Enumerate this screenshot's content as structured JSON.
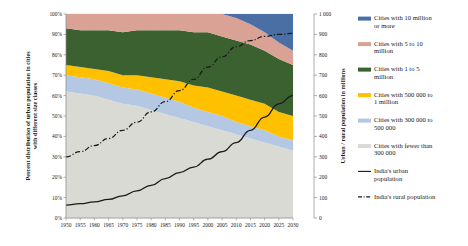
{
  "chart_data": {
    "type": "area",
    "title": "",
    "xlabel": "",
    "ylabel": "Percent distribution of urban population in cities with different size classes",
    "y2label": "Urban / rural population in millions",
    "x": [
      1950,
      1955,
      1960,
      1965,
      1970,
      1975,
      1980,
      1985,
      1990,
      1995,
      2000,
      2005,
      2010,
      2015,
      2020,
      2025,
      2030
    ],
    "xtick_labels": [
      "1950",
      "1955",
      "1960",
      "1965",
      "1970",
      "1975",
      "1980",
      "1985",
      "1990",
      "1995",
      "2000",
      "2005",
      "2010",
      "2015",
      "2020",
      "2025",
      "2030"
    ],
    "ylim": [
      0,
      100
    ],
    "ytick_labels": [
      "0%",
      "10%",
      "20%",
      "30%",
      "40%",
      "50%",
      "60%",
      "70%",
      "80%",
      "90%",
      "100%"
    ],
    "ytick_values": [
      0,
      10,
      20,
      30,
      40,
      50,
      60,
      70,
      80,
      90,
      100
    ],
    "y2lim": [
      0,
      1000
    ],
    "y2tick_labels": [
      "0",
      "100",
      "200",
      "300",
      "400",
      "500",
      "600",
      "700",
      "800",
      "900",
      "1 000"
    ],
    "y2tick_values": [
      0,
      100,
      200,
      300,
      400,
      500,
      600,
      700,
      800,
      900,
      1000
    ],
    "grid": true,
    "legend_position": "right",
    "stack_order_bottom_to_top": [
      "fewer_300k",
      "300k_500k",
      "500k_1m",
      "1m_5m",
      "5m_10m",
      "10m_plus"
    ],
    "series": [
      {
        "name": "Cities with fewer than 300 000",
        "key": "fewer_300k",
        "color": "#d9dad4",
        "values": [
          62,
          61,
          60,
          58,
          56,
          55,
          53,
          51,
          49,
          47,
          45,
          43,
          41,
          39,
          37,
          35,
          33
        ]
      },
      {
        "name": "Cities with 300 000 to 500 000",
        "key": "300k_500k",
        "color": "#b4c7e3",
        "values": [
          8,
          8,
          8,
          8,
          8,
          8,
          8,
          8,
          8,
          7,
          7,
          7,
          6,
          6,
          6,
          5,
          5
        ]
      },
      {
        "name": "Cities with 500 000 to 1 million",
        "key": "500k_1m",
        "color": "#ffc000",
        "values": [
          5,
          5,
          5,
          6,
          6,
          7,
          8,
          9,
          10,
          11,
          12,
          12,
          13,
          13,
          13,
          12,
          12
        ]
      },
      {
        "name": "Cities with 1 to 5 million",
        "key": "1m_5m",
        "color": "#3c6130",
        "values": [
          18,
          18,
          19,
          20,
          21,
          22,
          23,
          24,
          25,
          26,
          27,
          27,
          27,
          27,
          26,
          26,
          25
        ]
      },
      {
        "name": "Cities with 5 to 10 million",
        "key": "5m_10m",
        "color": "#d9a295",
        "values": [
          7,
          8,
          8,
          8,
          9,
          8,
          8,
          8,
          8,
          9,
          9,
          11,
          11,
          10,
          9,
          8,
          7
        ]
      },
      {
        "name": "Cities with 10 million or more",
        "key": "10m_plus",
        "color": "#4a6fa5",
        "values": [
          0,
          0,
          0,
          0,
          0,
          0,
          0,
          0,
          0,
          0,
          0,
          0,
          2,
          5,
          9,
          14,
          18
        ]
      }
    ],
    "lines": [
      {
        "name": "India's urban population",
        "key": "urban",
        "color": "#1a1a1a",
        "style": "solid",
        "values": [
          63,
          70,
          79,
          91,
          109,
          133,
          160,
          193,
          223,
          250,
          288,
          325,
          370,
          430,
          495,
          560,
          600
        ]
      },
      {
        "name": "India's rural population",
        "key": "rural",
        "color": "#1a1a1a",
        "style": "dashdot",
        "values": [
          300,
          325,
          355,
          390,
          430,
          470,
          520,
          570,
          625,
          680,
          740,
          790,
          840,
          870,
          890,
          900,
          905
        ]
      }
    ]
  },
  "legend": {
    "items": [
      {
        "label_line1": "Cities with 10 million",
        "label_line2": "or more",
        "color": "#4a6fa5",
        "type": "swatch"
      },
      {
        "label_line1": "Cities with 5 to 10",
        "label_line2": "million",
        "color": "#d9a295",
        "type": "swatch"
      },
      {
        "label_line1": "Cities with 1 to 5",
        "label_line2": "million",
        "color": "#3c6130",
        "type": "swatch"
      },
      {
        "label_line1": "Cities with 500 000 to",
        "label_line2": "1 million",
        "color": "#ffc000",
        "type": "swatch"
      },
      {
        "label_line1": "Cities with 300 000 to",
        "label_line2": "500 000",
        "color": "#b4c7e3",
        "type": "swatch"
      },
      {
        "label_line1": "Cities with fewer than",
        "label_line2": "300 000",
        "color": "#d9dad4",
        "type": "swatch"
      },
      {
        "label_line1": "India's urban",
        "label_line2": "population",
        "color": "#1a1a1a",
        "type": "line-solid"
      },
      {
        "label_line1": "India's rural population",
        "label_line2": "",
        "color": "#1a1a1a",
        "type": "line-dashdot"
      }
    ]
  }
}
